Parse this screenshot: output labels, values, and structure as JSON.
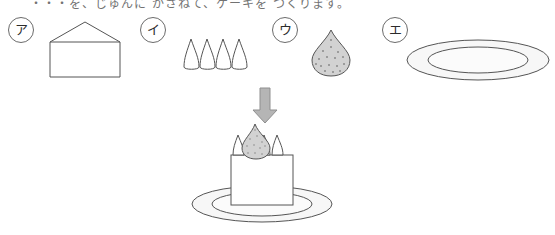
{
  "page": {
    "width": 555,
    "height": 235,
    "background": "#ffffff",
    "clipped_top_text": "・・・を、じゅんに かさねて、ケーキを つくります。"
  },
  "colors": {
    "outline": "#555555",
    "label_outline": "#6b6b6b",
    "label_text": "#2b2b2b",
    "strawberry_fill": "#d2d2d2",
    "strawberry_seed": "#8a8a8a",
    "arrow_fill": "#b5b5b5",
    "arrow_outline": "#8f8f8f",
    "plate_fill": "#f7f7f7",
    "plate_inner_fill": "#fbfbfb",
    "puff_fill": "#ffffff",
    "cake_fill": "#ffffff"
  },
  "choices": [
    {
      "id": "a",
      "label": "ア",
      "name": "sponge-cake-block",
      "description": "house-shaped pentagon outline (cake block)",
      "label_x": 8,
      "label_y": 17,
      "art": {
        "x": 50,
        "y": 22,
        "width": 72,
        "height": 53
      }
    },
    {
      "id": "i",
      "label": "イ",
      "name": "cream-puff-row",
      "description": "four teardrop cream puffs in a row",
      "label_x": 140,
      "label_y": 17,
      "count": 4,
      "art": {
        "x": 182,
        "y": 38,
        "width": 63,
        "height": 30
      }
    },
    {
      "id": "u",
      "label": "ウ",
      "name": "strawberry",
      "description": "gray speckled teardrop strawberry",
      "label_x": 272,
      "label_y": 17,
      "art": {
        "x": 312,
        "y": 30,
        "width": 38,
        "height": 45
      }
    },
    {
      "id": "e",
      "label": "エ",
      "name": "plate",
      "description": "oval plate with inner rim ellipse",
      "label_x": 382,
      "label_y": 17,
      "art": {
        "x": 408,
        "y": 39,
        "width": 140,
        "height": 41
      }
    }
  ],
  "arrow": {
    "name": "down-arrow",
    "direction": "down",
    "x": 252,
    "y": 88,
    "width": 25,
    "height": 34
  },
  "assembly": {
    "name": "assembled-cake",
    "description": "plate at bottom, cake block, row of cream puffs, strawberry on top",
    "plate": {
      "cx": 262,
      "cy": 204,
      "rx": 70,
      "ry": 18
    },
    "cake_body": {
      "x": 230,
      "y": 155,
      "width": 60,
      "height": 50
    },
    "puffs": {
      "count": 4,
      "y": 148
    },
    "strawberry": {
      "x": 248,
      "y": 126,
      "width": 26,
      "height": 32
    }
  }
}
